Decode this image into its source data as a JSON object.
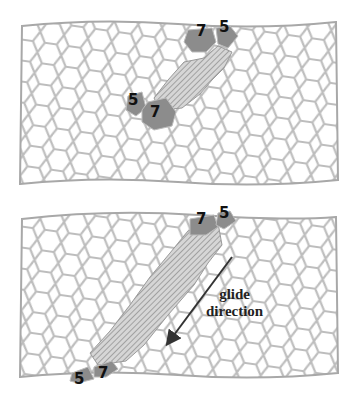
{
  "figure": {
    "panels": [
      {
        "id": "top",
        "description": "nanotube lattice with 5-7 defect pair, short shaded glide band",
        "labels": [
          {
            "text": "7",
            "x": 196,
            "y": 24
          },
          {
            "text": "5",
            "x": 219,
            "y": 20
          },
          {
            "text": "5",
            "x": 128,
            "y": 93
          },
          {
            "text": "7",
            "x": 150,
            "y": 105
          }
        ]
      },
      {
        "id": "bottom",
        "description": "nanotube lattice with 5-7 defects separated by long shaded glide band",
        "labels": [
          {
            "text": "7",
            "x": 196,
            "y": 212
          },
          {
            "text": "5",
            "x": 219,
            "y": 206
          },
          {
            "text": "5",
            "x": 74,
            "y": 372
          },
          {
            "text": "7",
            "x": 98,
            "y": 366
          }
        ],
        "annotation": {
          "line1": "glide",
          "line2": "direction"
        }
      }
    ],
    "colors": {
      "lattice": "#b8b8b8",
      "defect_fill": "#8c8c8c",
      "hatch": "#9a9a9a",
      "arrow": "#333333",
      "text": "#111111"
    }
  }
}
